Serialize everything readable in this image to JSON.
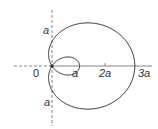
{
  "diagram": {
    "type": "limacon",
    "equation": "r = a + 2a cos θ",
    "origin_label": "0",
    "labels": {
      "y_top": "a",
      "y_bottom": "a",
      "inner_loop": "a",
      "x_2a": "2a",
      "x_3a": "3a"
    },
    "colors": {
      "curve": "#222222",
      "axis": "#666666"
    }
  }
}
